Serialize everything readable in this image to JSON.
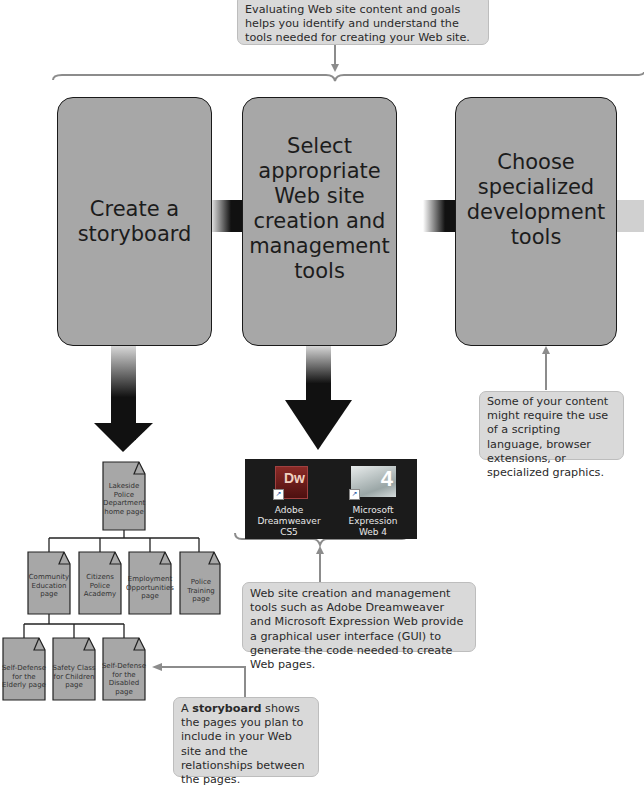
{
  "top_callout": {
    "text": "Evaluating Web site content and goals helps you identify and understand the tools needed for creating your Web site."
  },
  "steps": [
    {
      "label": "Create a\nstoryboard"
    },
    {
      "label": "Select\nappropriate\nWeb site\ncreation and\nmanagement\ntools"
    },
    {
      "label": "Choose\nspecialized\ndevelopment\ntools"
    }
  ],
  "storyboard": {
    "root": "Lakeside\nPolice\nDepartment\nhome page",
    "level1": [
      "Community\nEducation\npage",
      "Citizens\nPolice\nAcademy",
      "Employment\nOpportunities\npage",
      "Police Training\npage"
    ],
    "level2": [
      "Self-Defense\nfor the\nElderly page",
      "Safety Class\nfor Children\npage",
      "Self-Defense\nfor the\nDisabled\npage"
    ]
  },
  "tool_icons": [
    {
      "glyph": "Dw",
      "label": "Adobe\nDreamweaver\nCS5",
      "color": "#6b1a1a"
    },
    {
      "glyph": "4",
      "label": "Microsoft\nExpression\nWeb 4",
      "color": "#c8d0d0"
    }
  ],
  "specialized_callout": {
    "text": "Some of your content might require the use of a scripting language, browser extensions, or specialized graphics."
  },
  "tools_callout": {
    "text": "Web site creation and management tools such as Adobe Dreamweaver and Microsoft Expression Web provide a graphical user interface (GUI) to generate the code needed to create Web pages."
  },
  "storyboard_callout": {
    "prefix": "A ",
    "bold": "storyboard",
    "suffix": " shows the pages you plan to include in your Web site and the relationships between the pages."
  },
  "colors": {
    "step_fill": "#a7a7a7",
    "callout_fill": "#d9d9d9",
    "connector": "#8c8c8c",
    "arrow": "#111111"
  }
}
